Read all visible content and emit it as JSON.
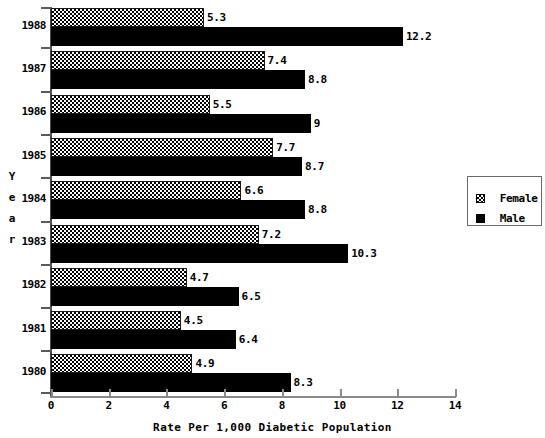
{
  "chart_data": {
    "type": "bar",
    "orientation": "horizontal",
    "title": "",
    "xlabel": "Rate Per 1,000 Diabetic Population",
    "ylabel": "Year",
    "ylabel_letters": [
      "Y",
      "e",
      "a",
      "r"
    ],
    "categories": [
      "1988",
      "1987",
      "1986",
      "1985",
      "1984",
      "1983",
      "1982",
      "1981",
      "1980"
    ],
    "series": [
      {
        "name": "Female",
        "fill": "checkered",
        "color": "#808080",
        "values": [
          5.3,
          7.4,
          5.5,
          7.7,
          6.6,
          7.2,
          4.7,
          4.5,
          4.9
        ],
        "labels": [
          "5.3",
          "7.4",
          "5.5",
          "7.7",
          "6.6",
          "7.2",
          "4.7",
          "4.5",
          "4.9"
        ]
      },
      {
        "name": "Male",
        "fill": "solid",
        "color": "#000000",
        "values": [
          12.2,
          8.8,
          9,
          8.7,
          8.8,
          10.3,
          6.5,
          6.4,
          8.3
        ],
        "labels": [
          "12.2",
          "8.8",
          "9",
          "8.7",
          "8.8",
          "10.3",
          "6.5",
          "6.4",
          "8.3"
        ]
      }
    ],
    "xlim": [
      0,
      14
    ],
    "xticks": [
      0,
      2,
      4,
      6,
      8,
      10,
      12,
      14
    ],
    "xtick_labels": [
      "0",
      "2",
      "4",
      "6",
      "8",
      "10",
      "12",
      "14"
    ],
    "grid": false,
    "legend": {
      "position": "right",
      "entries": [
        {
          "label": "Female",
          "swatch": "checkered-swatch"
        },
        {
          "label": "Male",
          "swatch": "solid-black-swatch"
        }
      ]
    }
  }
}
